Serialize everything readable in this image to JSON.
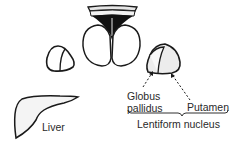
{
  "diagram": {
    "labels": {
      "liver": "Liver",
      "globus_pallidus_line1": "Globus",
      "globus_pallidus_line2": "pallidus",
      "putamen": "Putamen",
      "lentiform_nucleus": "Lentiform nucleus"
    },
    "structures": [
      "midbrain-cross-section",
      "left-lentiform-nucleus",
      "right-lentiform-nucleus",
      "liver"
    ],
    "colors": {
      "outline": "#1a1a1a",
      "fill": "#f4f4f4",
      "text": "#2a2a2a"
    }
  }
}
